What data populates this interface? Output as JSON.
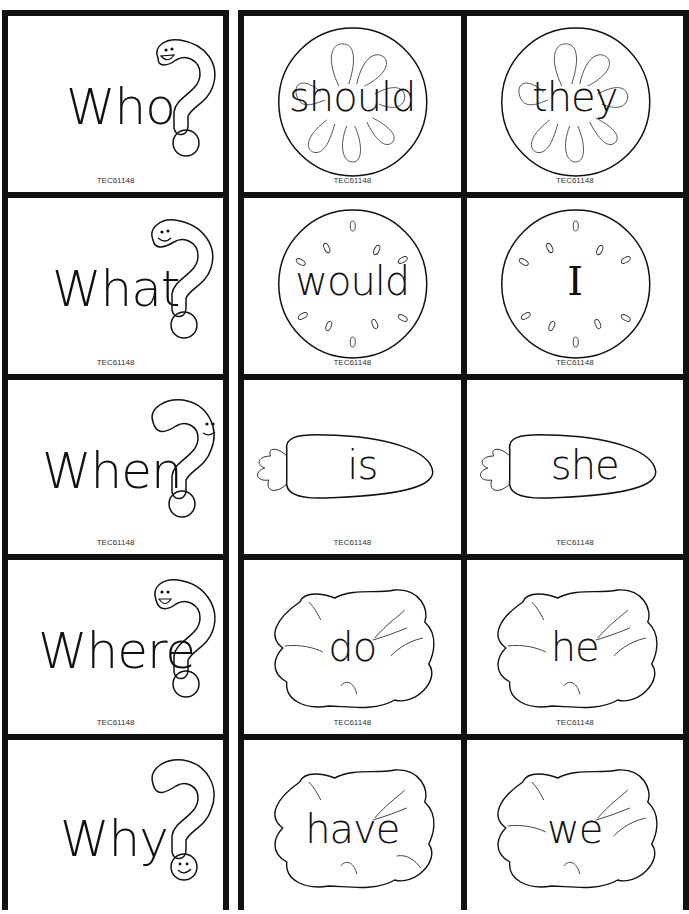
{
  "code_label": "TEC61148",
  "question_cards": [
    {
      "word": "Who",
      "face": "top"
    },
    {
      "word": "What",
      "face": "top"
    },
    {
      "word": "When",
      "face": "side"
    },
    {
      "word": "Where",
      "face": "top"
    },
    {
      "word": "Why",
      "face": "dot"
    }
  ],
  "word_cards": [
    {
      "row": 1,
      "shape": "orange-slice",
      "words": [
        "should",
        "they"
      ]
    },
    {
      "row": 2,
      "shape": "watermelon",
      "words": [
        "would",
        "I"
      ]
    },
    {
      "row": 3,
      "shape": "carrot",
      "words": [
        "is",
        "she"
      ]
    },
    {
      "row": 4,
      "shape": "lettuce",
      "words": [
        "do",
        "he"
      ]
    },
    {
      "row": 5,
      "shape": "lettuce",
      "words": [
        "have",
        "we"
      ]
    }
  ],
  "colors": {
    "border": "#111111",
    "background": "#ffffff",
    "ink": "#111111"
  }
}
